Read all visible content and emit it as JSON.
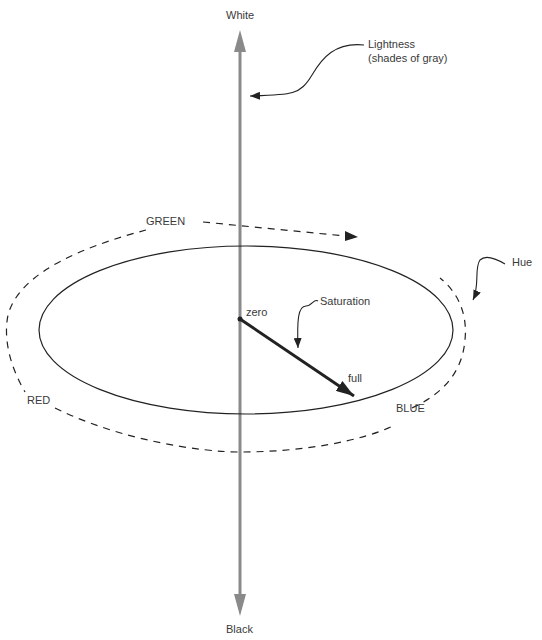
{
  "diagram": {
    "axis": {
      "top_label": "White",
      "bottom_label": "Black",
      "color": "#8a8a8a"
    },
    "annotations": {
      "lightness_line1": "Lightness",
      "lightness_line2": "(shades of gray)",
      "hue": "Hue",
      "saturation": "Saturation",
      "zero": "zero",
      "full": "full"
    },
    "hue_labels": {
      "green": "GREEN",
      "red": "RED",
      "blue": "BLUE"
    },
    "colors": {
      "line": "#222222",
      "text": "#3a3a3a",
      "axis": "#8a8a8a"
    }
  }
}
